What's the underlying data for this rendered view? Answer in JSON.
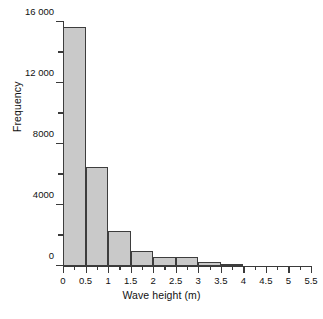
{
  "chart_data": {
    "type": "bar",
    "title": "",
    "xlabel": "Wave height (m)",
    "ylabel": "Frequency",
    "grid": false,
    "legend": null,
    "xlim": [
      0,
      5.5
    ],
    "ylim": [
      0,
      16000
    ],
    "bin_width": 0.5,
    "categories": [
      "0-0.5",
      "0.5-1",
      "1-1.5",
      "1.5-2",
      "2-2.5",
      "2.5-3",
      "3-3.5",
      "3.5-4"
    ],
    "bin_edges": [
      0,
      0.5,
      1,
      1.5,
      2,
      2.5,
      3,
      3.5,
      4
    ],
    "values": [
      15700,
      6500,
      2300,
      1000,
      600,
      600,
      260,
      120
    ],
    "xticks": [
      0,
      0.5,
      1,
      1.5,
      2,
      2.5,
      3,
      3.5,
      4,
      4.5,
      5,
      5.5
    ],
    "xtick_labels": [
      "0",
      "0.5",
      "1",
      "1.5",
      "2",
      "2.5",
      "3",
      "3.5",
      "4",
      "4.5",
      "5",
      "5.5"
    ],
    "xminor_step": 0.25,
    "yticks": [
      0,
      2000,
      4000,
      6000,
      8000,
      10000,
      12000,
      14000,
      16000
    ],
    "ytick_labels": [
      "0",
      "",
      "4000",
      "",
      "8000",
      "",
      "12 000",
      "",
      "16 000"
    ],
    "bar_fill_color": "#c9c9c9",
    "bar_edge_color": "#3d3d3d",
    "axis_color": "#3a3a3a",
    "text_color": "#111111",
    "background_color": "#ffffff"
  }
}
